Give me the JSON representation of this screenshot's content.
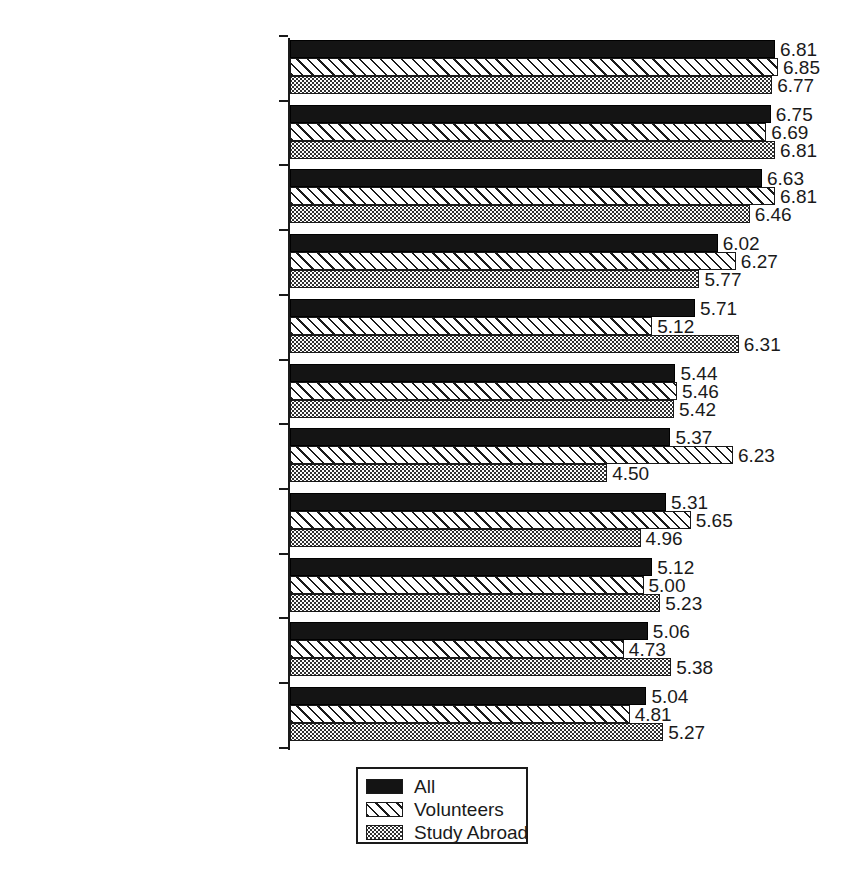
{
  "chart_data": {
    "type": "bar",
    "orientation": "horizontal",
    "title": "",
    "subtitle": "",
    "xlabel": "",
    "ylabel": "",
    "xlim": [
      0,
      7
    ],
    "grid": false,
    "legend_position": "bottom-center",
    "categories": [
      "To have new experiences",
      "To see the world",
      "To experience a new culture",
      "To give one a new\nperspective",
      "To have fun",
      "To participate in local\ntraditions/celebrations",
      "To help others",
      "To 'grow' emotionally,\nspiritually, psychologically",
      "To escape from ordinary life",
      "To achieve over challenges",
      "To develop skills"
    ],
    "series": [
      {
        "name": "All",
        "pattern": "solid-black",
        "values": [
          6.81,
          6.75,
          6.63,
          6.02,
          5.71,
          5.44,
          5.37,
          5.31,
          5.12,
          5.06,
          5.04
        ]
      },
      {
        "name": "Volunteers",
        "pattern": "diagonal-hatch",
        "values": [
          6.85,
          6.69,
          6.81,
          6.27,
          5.12,
          5.46,
          6.23,
          5.65,
          5.0,
          4.73,
          4.81
        ]
      },
      {
        "name": "Study Abroad",
        "pattern": "dotted-stipple",
        "values": [
          6.77,
          6.81,
          6.46,
          5.77,
          6.31,
          5.42,
          4.5,
          4.96,
          5.23,
          5.38,
          5.27
        ]
      }
    ],
    "value_labels": [
      [
        "6.81",
        "6.85",
        "6.77"
      ],
      [
        "6.75",
        "6.69",
        "6.81"
      ],
      [
        "6.63",
        "6.81",
        "6.46"
      ],
      [
        "6.02",
        "6.27",
        "5.77"
      ],
      [
        "5.71",
        "5.12",
        "6.31"
      ],
      [
        "5.44",
        "5.46",
        "5.42"
      ],
      [
        "5.37",
        "6.23",
        "4.50"
      ],
      [
        "5.31",
        "5.65",
        "4.96"
      ],
      [
        "5.12",
        "5.00",
        "5.23"
      ],
      [
        "5.06",
        "4.73",
        "5.38"
      ],
      [
        "5.04",
        "4.81",
        "5.27"
      ]
    ]
  },
  "legend": {
    "items": [
      {
        "label": "All",
        "pattern": "solid-black"
      },
      {
        "label": "Volunteers",
        "pattern": "diagonal-hatch"
      },
      {
        "label": "Study Abroad",
        "pattern": "dotted-stipple"
      }
    ]
  },
  "colors": {
    "ink": "#1a1a1a",
    "background": "#ffffff",
    "series_all_fill": "#141414"
  }
}
